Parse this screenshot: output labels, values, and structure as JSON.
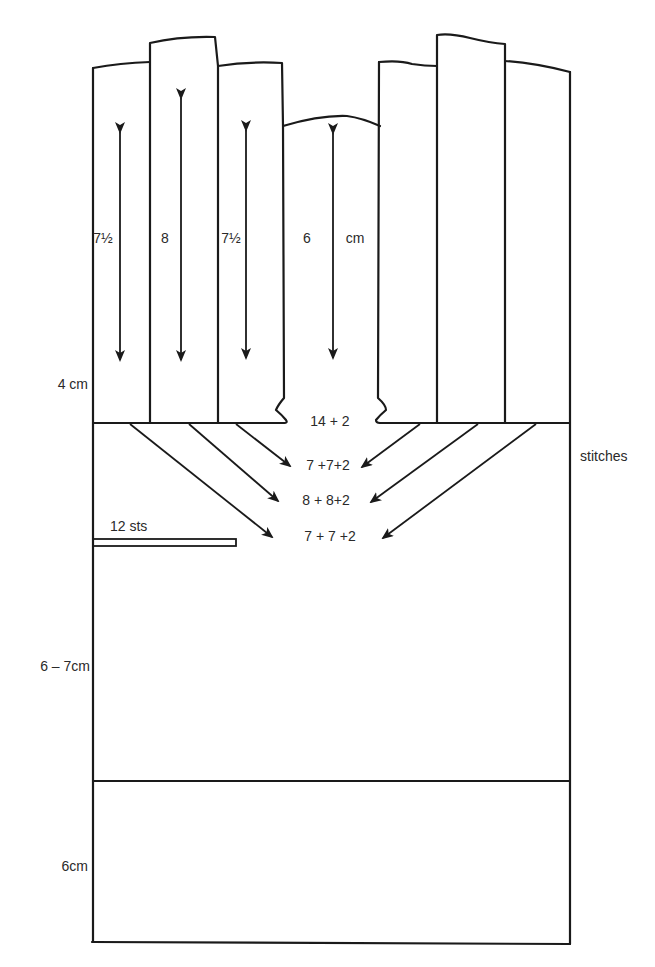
{
  "diagram": {
    "panels": {
      "widths": [
        {
          "label_whole": "7",
          "label_frac": "½",
          "text": "7½"
        },
        {
          "text": "8"
        },
        {
          "label_whole": "7",
          "label_frac": "½",
          "text": "7½"
        },
        {
          "text": "6"
        }
      ],
      "unit": "cm"
    },
    "labels": {
      "neck_stitches": "14  +  2",
      "row1": "7  +7+2",
      "row2": "8  + 8+2",
      "row3": "7  +  7 +2",
      "stitches": "stitches",
      "holder": "12 sts",
      "upper_section_height": "4 cm",
      "middle_section_height": "6 – 7cm",
      "lower_section_height": "6cm"
    },
    "colors": {
      "line": "#1a1a1a",
      "background": "#ffffff",
      "text": "#2a2a2a"
    }
  }
}
